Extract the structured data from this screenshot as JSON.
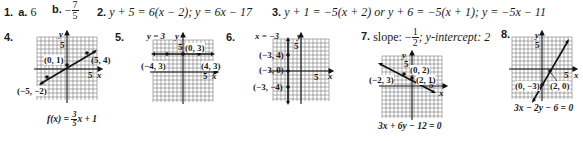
{
  "answers": {
    "q1": {
      "num": "1.",
      "a_label": "a.",
      "a_value": "6",
      "b_label": "b.",
      "b_sign": "−",
      "b_num": "7",
      "b_den": "5"
    },
    "q2": {
      "num": "2.",
      "text": "y + 5 = 6(x − 2); y = 6x − 17"
    },
    "q3": {
      "num": "3.",
      "text": "y + 1 = −5(x + 2) or y + 6 = −5(x + 1); y = −5x − 11"
    },
    "q7": {
      "num": "7.",
      "pre": "slope: −",
      "frac_num": "1",
      "frac_den": "2",
      "post": "; y-intercept: 2"
    }
  },
  "graphs": {
    "g4": {
      "num": "4.",
      "equation_pre": "f(x) = ",
      "eq_frac_num": "3",
      "eq_frac_den": "5",
      "equation_post": "x + 1",
      "tick_label_y": "5",
      "tick_label_x": "5",
      "axis_x": "x",
      "axis_y": "y",
      "points": [
        {
          "label": "(0, 1)"
        },
        {
          "label": "(5, 4)"
        },
        {
          "label": "(−5, −2)"
        }
      ]
    },
    "g5": {
      "num": "5.",
      "line_label": "y = 3",
      "tick_label_y": "5",
      "tick_label_x": "5",
      "axis_x": "x",
      "axis_y": "y",
      "points": [
        {
          "label": "(0, 3)"
        },
        {
          "label": "(−4, 3)"
        },
        {
          "label": "(4, 3)"
        }
      ]
    },
    "g6": {
      "num": "6.",
      "line_label": "x = −3",
      "tick_label_y": "5",
      "tick_label_x": "5",
      "axis_x": "x",
      "axis_y": "y",
      "points": [
        {
          "label": "(−3, 4)"
        },
        {
          "label": "(−3, 0)"
        },
        {
          "label": "(−3, −4)"
        }
      ]
    },
    "g7": {
      "equation": "3x + 6y − 12 = 0",
      "tick_label_y": "5",
      "tick_label_x": "5",
      "axis_x": "x",
      "axis_y": "y",
      "points": [
        {
          "label": "(0, 2)"
        },
        {
          "label": "(−2, 3)"
        },
        {
          "label": "(2, 1)"
        }
      ]
    },
    "g8": {
      "num": "8.",
      "equation": "3x − 2y − 6 = 0",
      "tick_label_y": "5",
      "tick_label_x": "5",
      "axis_x": "x",
      "axis_y": "y",
      "points": [
        {
          "label": "(0, −3)"
        },
        {
          "label": "(2, 0)"
        }
      ]
    }
  }
}
